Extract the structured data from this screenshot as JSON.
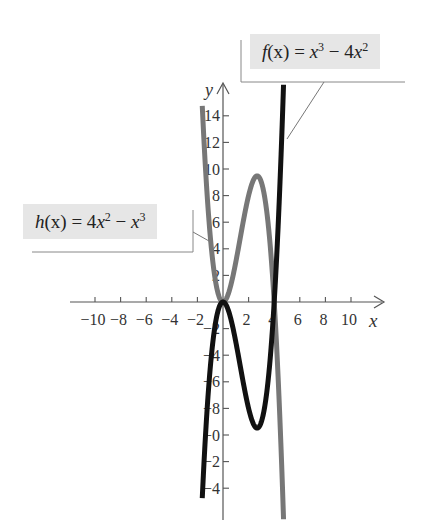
{
  "chart_data": {
    "type": "line",
    "title": "",
    "xlabel": "x",
    "ylabel": "y",
    "xlim": [
      -11,
      12
    ],
    "ylim": [
      -15.5,
      16
    ],
    "x_ticks": [
      -10,
      -8,
      -6,
      -4,
      -2,
      2,
      4,
      6,
      8,
      10
    ],
    "x_tick_labels": [
      "−10",
      "−8",
      "−6",
      "−4",
      "−2",
      "2",
      "4",
      "6",
      "8",
      "10"
    ],
    "y_ticks": [
      -14,
      -12,
      -10,
      -8,
      -6,
      -4,
      -2,
      2,
      4,
      6,
      8,
      10,
      12,
      14
    ],
    "y_tick_labels": [
      "−4",
      "−2",
      "−0",
      "−8",
      "−6",
      "−4",
      "−2",
      "2",
      "4",
      "6",
      "8",
      "10",
      "12",
      "14"
    ],
    "grid": false,
    "series": [
      {
        "name": "f(x) = x^3 − 4x^2",
        "color": "#111111",
        "expression": "x^3 - 4x^2",
        "x_range": [
          -1.62,
          4.73
        ],
        "key_points": [
          {
            "x": 0,
            "y": 0,
            "note": "local max"
          },
          {
            "x": 2.67,
            "y": -9.48,
            "note": "local min"
          },
          {
            "x": 4,
            "y": 0,
            "note": "root"
          }
        ]
      },
      {
        "name": "h(x) = 4x^2 − x^3",
        "color": "#777777",
        "expression": "4x^2 - x^3",
        "x_range": [
          -1.62,
          4.73
        ],
        "key_points": [
          {
            "x": 0,
            "y": 0,
            "note": "local min"
          },
          {
            "x": 2.67,
            "y": 9.48,
            "note": "local max"
          },
          {
            "x": 4,
            "y": 0,
            "note": "root"
          }
        ]
      }
    ],
    "annotations": [
      {
        "text": "f(x) = x³ − 4x²",
        "points_to": "f"
      },
      {
        "text": "h(x) = 4x² − x³",
        "points_to": "h"
      }
    ]
  },
  "labels": {
    "f": {
      "name": "f",
      "arg": "(x)",
      "eq": " = ",
      "t1": "x",
      "e1": "3",
      "op": " − 4",
      "t2": "x",
      "e2": "2"
    },
    "h": {
      "name": "h",
      "arg": "(x)",
      "eq": " = 4",
      "t1": "x",
      "e1": "2",
      "op": " − ",
      "t2": "x",
      "e2": "3"
    },
    "x_axis": "x",
    "y_axis": "y"
  },
  "colors": {
    "f_curve": "#111111",
    "h_curve": "#777777",
    "axis": "#555555",
    "label_bg": "#e6e6e6"
  }
}
